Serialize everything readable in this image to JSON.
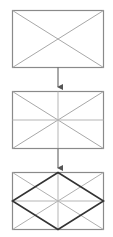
{
  "diagram": {
    "colors": {
      "frame": "#8a8a8a",
      "light_line": "#a8a8a8",
      "bold_line": "#333333",
      "arrow": "#555555"
    },
    "steps": [
      {
        "id": 1,
        "label": "Rectangle with diagonals"
      },
      {
        "id": 2,
        "label": "Add horizontal and vertical center lines"
      },
      {
        "id": 3,
        "label": "Connect midpoints to form rhombus"
      }
    ]
  }
}
